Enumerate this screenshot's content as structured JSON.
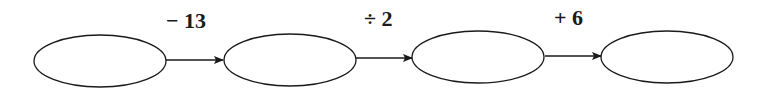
{
  "diagram": {
    "type": "flow-chain",
    "nodes": [
      {
        "id": "box1",
        "value": ""
      },
      {
        "id": "box2",
        "value": ""
      },
      {
        "id": "box3",
        "value": ""
      },
      {
        "id": "box4",
        "value": ""
      }
    ],
    "operations": [
      {
        "label": "− 13"
      },
      {
        "label": "÷ 2"
      },
      {
        "label": "+ 6"
      }
    ],
    "colors": {
      "stroke": "#1a1a1a",
      "background": "#ffffff"
    }
  }
}
